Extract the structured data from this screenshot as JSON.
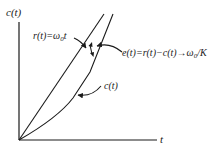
{
  "diagram": {
    "axes": {
      "y_label": "c(t)",
      "x_label": "t"
    },
    "curves": {
      "ramp_input": {
        "label_prefix": "r(t)=ω",
        "label_sub": "0",
        "label_suffix": "t"
      },
      "response": {
        "label": "c(t)"
      }
    },
    "error_annotation": {
      "label_prefix": "e(t)=r(t)−c(t)→ω",
      "label_sub": "0",
      "label_suffix": "/K"
    },
    "colors": {
      "ink": "#1a1a1a",
      "background": "#ffffff"
    }
  }
}
